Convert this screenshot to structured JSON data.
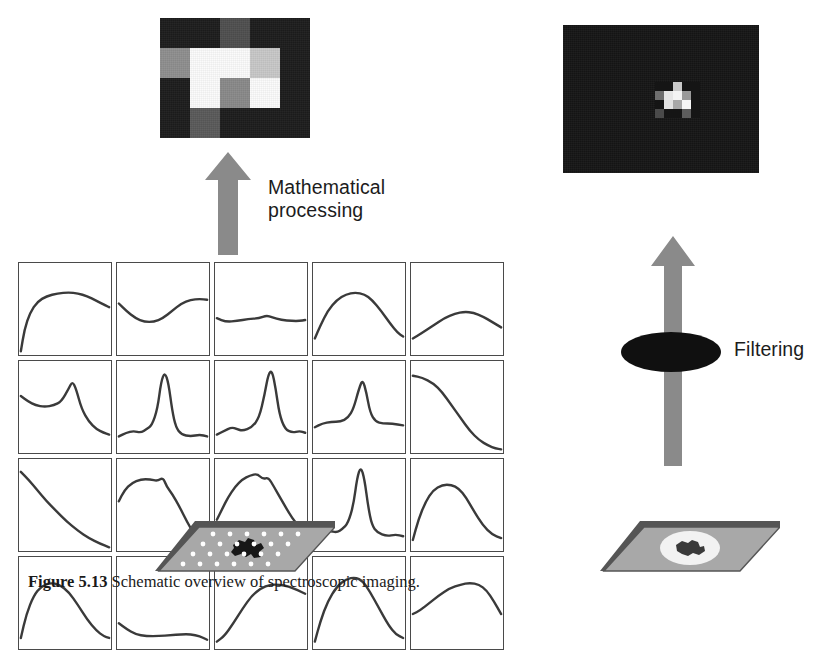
{
  "figure": {
    "caption_number": "Figure 5.13",
    "caption_text": "Schematic overview of spectroscopic imaging."
  },
  "labels": {
    "math_processing": "Mathematical\nprocessing",
    "filtering": "Filtering"
  },
  "mosaic_large": {
    "name": "chemical-image-mosaic",
    "cols": 5,
    "rows": 4,
    "x": 160,
    "y": 18,
    "width": 150,
    "height": 120,
    "background": "#1b1b1b",
    "cells": [
      [
        "#1d1d1d",
        "#1d1d1d",
        "#4f4f4f",
        "#1d1d1d",
        "#1d1d1d"
      ],
      [
        "#8f8f8f",
        "#fbfbfb",
        "#fbfbfb",
        "#c8c8c8",
        "#1d1d1d"
      ],
      [
        "#1d1d1d",
        "#fbfbfb",
        "#8a8a8a",
        "#fbfbfb",
        "#1d1d1d"
      ],
      [
        "#1d1d1d",
        "#5a5a5a",
        "#1d1d1d",
        "#1d1d1d",
        "#1d1d1d"
      ]
    ]
  },
  "mosaic_small": {
    "name": "filtered-chemical-image",
    "cols": 5,
    "rows": 4,
    "x": 655,
    "y": 82,
    "width": 45,
    "height": 36,
    "background": "#151515",
    "panel": {
      "x": 563,
      "y": 25,
      "width": 196,
      "height": 148,
      "color": "#161616"
    },
    "cells": [
      [
        "#151515",
        "#151515",
        "#c9c9c9",
        "#151515",
        "#151515"
      ],
      [
        "#6e6e6e",
        "#e6e6e6",
        "#f4f4f4",
        "#9a9a9a",
        "#151515"
      ],
      [
        "#151515",
        "#e2e2e2",
        "#a8a8a8",
        "#f6f6f6",
        "#151515"
      ],
      [
        "#4a4a4a",
        "#151515",
        "#151515",
        "#5c5c5c",
        "#151515"
      ]
    ]
  },
  "spectra_grid": {
    "name": "spectra-plot-grid",
    "x": 18,
    "y": 262,
    "width": 486,
    "height": 220,
    "cols": 5,
    "rows": 4,
    "curve_color": "#3a3a3a",
    "border_color": "#4a4a4a",
    "plots": [
      {
        "id": "r1c1",
        "shape": "rising-broad-hump",
        "points": "2,96 6,72 12,54 20,42 30,36 42,33 54,32 64,33 74,36 84,41 92,45 96,47 98,48"
      },
      {
        "id": "r1c2",
        "shape": "valley-then-rise",
        "points": "2,44 10,52 20,60 30,64 40,64 50,60 60,52 70,44 80,40 90,39 98,40"
      },
      {
        "id": "r1c3",
        "shape": "flat-low-ripple",
        "points": "2,60 12,64 24,63 36,61 48,60 56,57 62,59 72,62 84,63 92,63 98,62"
      },
      {
        "id": "r1c4",
        "shape": "broad-centered-hump",
        "points": "2,82 8,68 16,52 26,40 36,34 46,32 56,34 64,40 74,52 84,66 92,76 98,80"
      },
      {
        "id": "r1c5",
        "shape": "gentle-wide-rise",
        "points": "2,82 12,76 24,68 36,60 48,55 58,53 68,54 78,58 88,64 98,70"
      },
      {
        "id": "r2c1",
        "shape": "shoulder-with-peak",
        "points": "2,38 10,44 18,48 28,50 38,48 46,44 54,30 58,22 62,30 68,52 76,66 84,74 92,78 98,80"
      },
      {
        "id": "r2c2",
        "shape": "sharp-narrow-peak",
        "points": "2,82 10,78 18,76 26,78 32,74 38,70 44,52 48,22 52,12 56,24 60,54 64,72 70,80 80,82 90,80 98,82"
      },
      {
        "id": "r2c3",
        "shape": "sharp-peak-right-of-center",
        "points": "2,80 10,76 18,72 24,74 30,76 40,72 48,62 54,36 58,14 62,10 66,30 70,58 76,74 84,78 92,76 98,78"
      },
      {
        "id": "r2c4",
        "shape": "medium-peak",
        "points": "2,72 10,68 20,66 30,66 38,62 44,52 50,30 54,20 58,34 62,56 68,66 76,68 86,68 98,70"
      },
      {
        "id": "r2c5",
        "shape": "sigmoid-decay",
        "points": "2,16 12,18 24,24 34,34 44,48 54,62 64,76 74,86 84,92 92,95 98,96"
      },
      {
        "id": "r3c1",
        "shape": "decay-from-top-left",
        "points": "2,14 10,22 20,34 30,46 40,56 52,68 64,78 76,86 88,92 98,96"
      },
      {
        "id": "r3c2",
        "shape": "plateau-then-drop",
        "points": "2,46 8,34 16,26 26,22 36,22 44,24 50,20 54,30 60,38 68,52 76,68 84,82 92,92 98,96"
      },
      {
        "id": "r3c3",
        "shape": "rise-plateau-drop",
        "points": "2,66 8,54 14,42 22,30 30,22 38,18 46,16 52,22 58,20 64,30 72,44 80,58 88,70 98,80"
      },
      {
        "id": "r3c4",
        "shape": "tall-sharp-peak",
        "points": "2,82 10,80 18,78 26,80 32,76 38,70 44,50 48,20 52,8 56,22 60,52 64,72 70,80 80,84 90,82 98,84"
      },
      {
        "id": "r3c5",
        "shape": "broad-asymmetric-hump",
        "points": "2,88 8,66 16,46 24,34 34,28 44,28 52,32 60,42 68,56 78,72 88,82 98,86"
      },
      {
        "id": "r4c1",
        "shape": "dome-left",
        "points": "2,88 8,62 16,42 24,32 34,28 44,30 54,38 64,52 74,68 84,80 92,86 98,88"
      },
      {
        "id": "r4c2",
        "shape": "shallow-basin",
        "points": "2,72 10,78 20,84 32,86 46,86 58,85 70,84 80,84 90,86 98,90"
      },
      {
        "id": "r4c3",
        "shape": "s-curve-rise",
        "points": "2,92 10,86 20,72 30,56 40,42 50,34 60,30 70,30 80,32 90,36 98,40"
      },
      {
        "id": "r4c4",
        "shape": "dome-centered",
        "points": "2,92 8,70 16,48 26,32 36,24 46,22 54,26 62,38 72,56 82,74 90,84 98,88"
      },
      {
        "id": "r4c5",
        "shape": "rise-to-broad-top",
        "points": "2,62 10,58 20,50 30,42 42,34 54,30 64,28 74,30 82,36 90,48 98,62"
      }
    ]
  },
  "arrows": {
    "math": {
      "name": "math-processing-arrow",
      "x": 205,
      "y": 152,
      "width": 46,
      "height": 103,
      "color": "#8a8a8a"
    },
    "filter": {
      "name": "filtering-arrow",
      "x": 651,
      "y": 236,
      "width": 44,
      "height": 230,
      "color": "#8a8a8a"
    }
  },
  "filter_element": {
    "name": "optical-filter-ellipse",
    "x": 621,
    "y": 332,
    "width": 100,
    "height": 40,
    "color": "#101010"
  },
  "slides": {
    "left": {
      "name": "sample-slide-gridded",
      "x": 155,
      "y": 515,
      "width": 180,
      "height": 62,
      "surface": "#a8a8a8",
      "edge": "#555555",
      "specimen": "#171717",
      "dots": "#ffffff",
      "dot_rows": 4,
      "dot_cols": 6
    },
    "right": {
      "name": "sample-slide-plain",
      "x": 600,
      "y": 515,
      "width": 180,
      "height": 62,
      "surface": "#a8a8a8",
      "edge": "#555555",
      "specimen": "#3a3a3a",
      "halo": "#f2f2f2"
    }
  }
}
